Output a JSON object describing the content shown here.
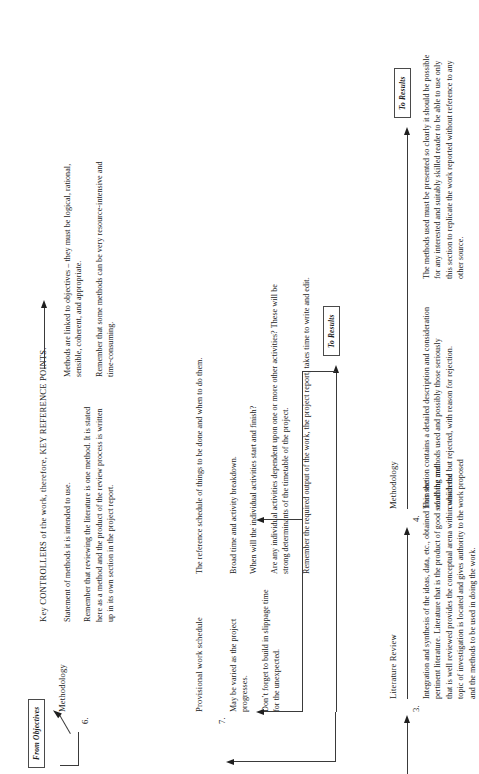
{
  "diagram": {
    "title_caption": "Key CONTROLLERS of the work, therefore, KEY REFERENCE POINTS.",
    "entry_label": "From Objectives",
    "exit_label_1": "To Results",
    "exit_label_2": "To Results",
    "accent_color": "#1f1f1f",
    "line_color": "#3a3a3a"
  },
  "sections": [
    {
      "number": "3.",
      "heading": "Literature Review",
      "paragraphs": [
        "Integration and synthesis of the ideas, data, etc., obtained from the pertinent literature.  Literature that is the product of good searching and that is well reviewed provides the conceptual arena within which the topic of investigation is located and gives authority to the work proposed and the methods to be used in doing the work."
      ]
    },
    {
      "number": "4.",
      "heading": "Methodology",
      "paragraphs": [
        "This section contains a detailed description and consideration of all the methods used and possibly those seriously considered but rejected, with reason for rejection.",
        "The methods used must be presented so clearly it should be possible for any interested and suitably skilled reader to be able to use only this section to replicate the work reported without reference to any other source."
      ]
    },
    {
      "number": "6.",
      "heading": "Methodology",
      "paragraphs": [
        "Statement of methods it is intended to use.",
        "Remember that reviewing the literature is one method.  It is stated here as a method and the product of the review process is written up in its own section in the project report.",
        "Methods are linked to objectives – they must be logical, rational, sensible, coherent, and appropriate.",
        "Remember that some methods can be very resource-intensive and time-consuming."
      ]
    },
    {
      "number": "7.",
      "heading": "Provisional work schedule",
      "paragraphs": [
        "The reference schedule of things to be done and when to do them.",
        "Broad time and activity breakdown.",
        "When will the individual activities start and finish?",
        "Are any individual activities dependent upon one or more other activities?  These will be strong determinants of the timetable of the project.",
        "Remember the required output of the work, the project report, takes time to write and edit."
      ],
      "side_notes": [
        "May be varied as the project progresses.",
        "Don’t forget to build in slippage time for the unexpected."
      ]
    }
  ]
}
